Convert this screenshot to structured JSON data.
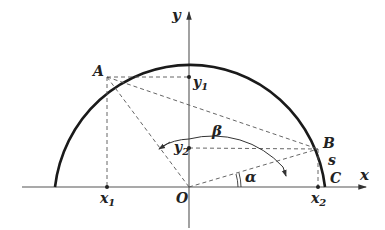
{
  "diagram": {
    "type": "geometry",
    "axes": {
      "x_label": "x",
      "y_label": "y",
      "origin_label": "O"
    },
    "points": {
      "A": "A",
      "B": "B",
      "C": "C"
    },
    "coordinate_labels": {
      "x1": "x",
      "x1_sub": "1",
      "x2": "x",
      "x2_sub": "2",
      "y1": "y",
      "y1_sub": "1",
      "y2": "y",
      "y2_sub": "2"
    },
    "angles": {
      "alpha": "α",
      "beta": "β"
    },
    "arc_label": "s",
    "colors": {
      "stroke": "#222222",
      "dashed": "#555555",
      "background": "#ffffff"
    }
  }
}
